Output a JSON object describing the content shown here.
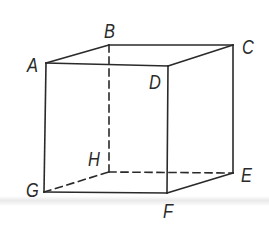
{
  "diagram": {
    "type": "cube",
    "stroke_color": "#2a2a2a",
    "vertices": {
      "A": {
        "label": "A",
        "x": 46,
        "y": 63,
        "label_x": 27,
        "label_y": 55
      },
      "B": {
        "label": "B",
        "x": 109,
        "y": 45,
        "label_x": 104,
        "label_y": 21
      },
      "C": {
        "label": "C",
        "x": 233,
        "y": 45,
        "label_x": 242,
        "label_y": 37
      },
      "D": {
        "label": "D",
        "x": 168,
        "y": 66,
        "label_x": 149,
        "label_y": 72
      },
      "E": {
        "label": "E",
        "x": 233,
        "y": 173,
        "label_x": 241,
        "label_y": 165
      },
      "F": {
        "label": "F",
        "x": 167,
        "y": 193,
        "label_x": 163,
        "label_y": 201
      },
      "G": {
        "label": "G",
        "x": 44,
        "y": 192,
        "label_x": 26,
        "label_y": 180
      },
      "H": {
        "label": "H",
        "x": 109,
        "y": 172,
        "label_x": 88,
        "label_y": 149
      }
    },
    "solid_edges": [
      [
        "A",
        "B"
      ],
      [
        "B",
        "C"
      ],
      [
        "A",
        "D"
      ],
      [
        "C",
        "D"
      ],
      [
        "A",
        "G"
      ],
      [
        "D",
        "F"
      ],
      [
        "C",
        "E"
      ],
      [
        "G",
        "F"
      ],
      [
        "F",
        "E"
      ]
    ],
    "hidden_edges": [
      [
        "B",
        "H"
      ],
      [
        "G",
        "H"
      ],
      [
        "H",
        "E"
      ]
    ]
  }
}
